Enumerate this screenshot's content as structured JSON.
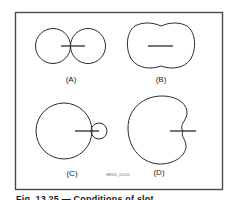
{
  "figure": {
    "panels": [
      {
        "id": "A",
        "label": "(A)",
        "description": "figure-eight pattern: two equal tangent circles with a horizontal element crossing the tangent point"
      },
      {
        "id": "B",
        "label": "(B)",
        "description": "peanut-shaped pattern with slight waist, horizontal element centered"
      },
      {
        "id": "C",
        "label": "(C)",
        "description": "large circle with small tangent circle on the right, horizontal element through the tangent point"
      },
      {
        "id": "D",
        "label": "(D)",
        "description": "cardioid-like pattern with notch on the right, horizontal element at the notch"
      }
    ],
    "code": "HB905_13-025",
    "frame_color": "#4a4a4a",
    "stroke_color": "#2a2a2a"
  },
  "caption": {
    "text": "Fig. 13.25 — Conditions of slot..."
  }
}
